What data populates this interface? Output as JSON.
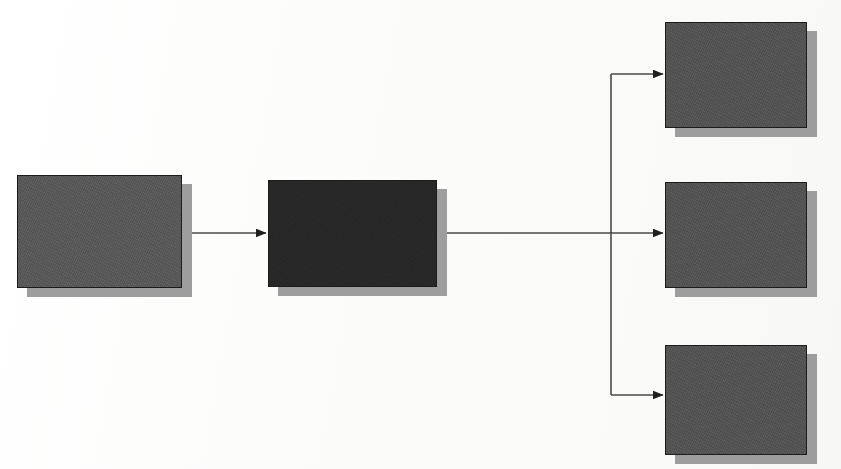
{
  "diagram": {
    "type": "flow-diagram",
    "background_color": "#ffffff",
    "nodes": [
      {
        "id": "knowledge-management",
        "label": "Knowledge\nManagement",
        "fill_color": "#5a5a5a",
        "text_color": "#ffffff",
        "shadow_color": "#9d9d9d"
      },
      {
        "id": "management-information-systems",
        "label": "Management\nInformation\nSystems",
        "fill_color": "#282828",
        "text_color": "#ffffff",
        "shadow_color": "#9d9d9d"
      },
      {
        "id": "decision-support-systems",
        "label": "Decision\nSupport\nSystems",
        "fill_color": "#555555",
        "text_color": "#ffffff",
        "shadow_color": "#9d9d9d"
      },
      {
        "id": "executive-information-systems",
        "label": "Executive\nInformation\nSystems",
        "fill_color": "#555555",
        "text_color": "#ffffff",
        "shadow_color": "#9d9d9d"
      },
      {
        "id": "groupware-systems",
        "label": "Groupware\nSystems",
        "fill_color": "#555555",
        "text_color": "#ffffff",
        "shadow_color": "#9d9d9d"
      }
    ],
    "connectors": [
      {
        "id": "km-to-mis",
        "from": "knowledge-management",
        "to": "management-information-systems",
        "style": "straight-arrow",
        "color": "#4a4a4a"
      },
      {
        "id": "mis-to-dss",
        "from": "management-information-systems",
        "to": "decision-support-systems",
        "style": "elbow-arrow-up",
        "color": "#4a4a4a"
      },
      {
        "id": "mis-to-eis",
        "from": "management-information-systems",
        "to": "executive-information-systems",
        "style": "straight-arrow",
        "color": "#4a4a4a"
      },
      {
        "id": "mis-to-gws",
        "from": "management-information-systems",
        "to": "groupware-systems",
        "style": "elbow-arrow-down",
        "color": "#4a4a4a"
      }
    ]
  }
}
